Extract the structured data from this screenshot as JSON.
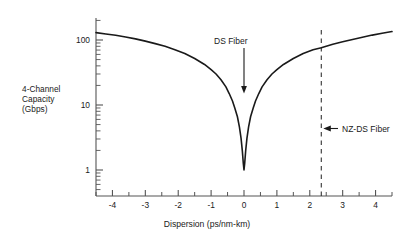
{
  "chart_data": {
    "type": "line",
    "title": "",
    "xlabel": "Dispersion (ps/nm-km)",
    "ylabel": "4-Channel Capacity (Gbps)",
    "ylabel_lines": [
      "4-Channel",
      "Capacity",
      "(Gbps)"
    ],
    "yscale": "log",
    "xscale": "linear",
    "xlim": [
      -4.5,
      4.5
    ],
    "ylim": [
      0.45,
      260
    ],
    "grid": false,
    "legend": null,
    "xticks": [
      -4,
      -3,
      -2,
      -1,
      0,
      1,
      2,
      3,
      4
    ],
    "xtick_labels": [
      "-4",
      "-3",
      "-2",
      "-1",
      "0",
      "1",
      "2",
      "3",
      "4"
    ],
    "xminor_ticks": [
      -4.5,
      -3.5,
      -2.5,
      -1.5,
      -0.5,
      0.5,
      1.5,
      2.5,
      3.5,
      4.5
    ],
    "yticks": [
      1,
      10,
      100
    ],
    "ytick_labels": [
      "1",
      "10",
      "100"
    ],
    "yminor_ticks": [
      0.5,
      0.6,
      0.7,
      0.8,
      0.9,
      2,
      3,
      4,
      5,
      6,
      7,
      8,
      9,
      20,
      30,
      40,
      50,
      60,
      70,
      80,
      90,
      200
    ],
    "series": [
      {
        "name": "4-Channel Capacity",
        "x": [
          -4.5,
          -4.2,
          -3.9,
          -3.6,
          -3.3,
          -3.0,
          -2.7,
          -2.4,
          -2.1,
          -1.8,
          -1.5,
          -1.2,
          -1.0,
          -0.85,
          -0.7,
          -0.55,
          -0.45,
          -0.35,
          -0.28,
          -0.2,
          -0.14,
          -0.09,
          -0.05,
          -0.02,
          0.0,
          0.02,
          0.05,
          0.09,
          0.14,
          0.2,
          0.28,
          0.35,
          0.45,
          0.55,
          0.7,
          0.85,
          1.0,
          1.2,
          1.5,
          1.8,
          2.1,
          2.35,
          2.7,
          3.0,
          3.3,
          3.6,
          3.9,
          4.2,
          4.5
        ],
        "y": [
          130,
          124,
          118,
          111,
          104,
          96,
          88,
          80,
          71,
          62,
          52,
          42,
          35,
          30,
          24.5,
          19,
          15,
          11.5,
          9.0,
          6.6,
          4.6,
          3.1,
          1.95,
          1.25,
          1.0,
          1.25,
          1.95,
          3.1,
          4.6,
          6.6,
          9.0,
          11.5,
          15,
          19,
          24.5,
          30,
          35,
          42,
          52,
          62,
          71,
          76,
          86,
          94,
          102,
          110,
          119,
          127,
          135
        ]
      }
    ],
    "annotations": [
      {
        "id": "ds-fiber",
        "label": "DS Fiber",
        "x": 0,
        "marker": "arrow-down",
        "points_to": "curve minimum at dispersion 0"
      },
      {
        "id": "nz-ds-fiber",
        "label": "NZ-DS Fiber",
        "x": 2.35,
        "marker": "arrow-left",
        "points_to": "dashed vertical line at dispersion 2.35"
      }
    ],
    "reference_lines": [
      {
        "id": "nz-ds-dashed-line",
        "orientation": "vertical",
        "x": 2.35,
        "style": "dashed"
      }
    ]
  },
  "colors": {
    "curve": "#1a1a1a",
    "axis": "#555555",
    "text": "#1a1a1a",
    "dashed": "#333333",
    "background": "#ffffff"
  }
}
